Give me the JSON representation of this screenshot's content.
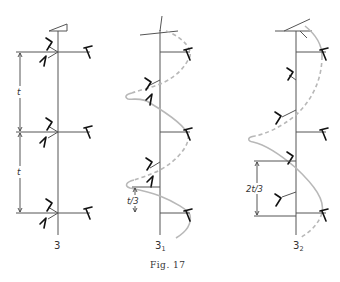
{
  "figure": {
    "caption": "Fig. 17",
    "panels": [
      {
        "id": "panel-3",
        "label": "3",
        "dimension_labels": [
          "t",
          "t"
        ]
      },
      {
        "id": "panel-3-1",
        "label": "3",
        "label_subscript": "1",
        "dimension_labels": [
          "t/3"
        ]
      },
      {
        "id": "panel-3-2",
        "label": "3",
        "label_subscript": "2",
        "dimension_labels": [
          "2t/3"
        ]
      }
    ]
  },
  "colors": {
    "axis": "#555555",
    "leaf": "#111111",
    "helix": "#b8b8b8",
    "background": "#ffffff"
  }
}
